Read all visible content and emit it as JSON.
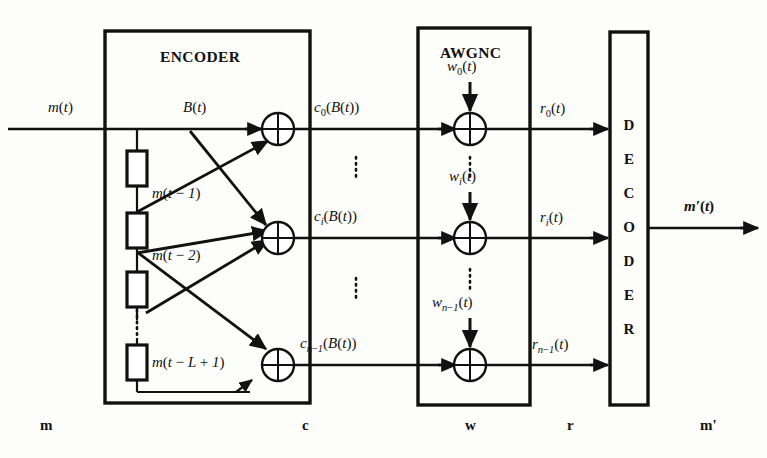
{
  "figure": {
    "type": "block-diagram"
  },
  "blocks": {
    "encoder": {
      "title": "ENCODER",
      "x": 105,
      "y": 31,
      "w": 205,
      "h": 372
    },
    "awgnc": {
      "title": "AWGNC",
      "x": 418,
      "y": 28,
      "w": 112,
      "h": 377
    },
    "decoder": {
      "title": "DECODER",
      "x": 610,
      "y": 32,
      "w": 38,
      "h": 373,
      "letters": [
        "D",
        "E",
        "C",
        "O",
        "D",
        "E",
        "R"
      ]
    }
  },
  "signals": {
    "input": "m(t)",
    "branch": "B(t)",
    "encoder_out_0": "c0(B(t))",
    "encoder_out_i": "ci(B(t))",
    "encoder_out_n1": "cn-1(B(t))",
    "noise_0": "w0(t)",
    "noise_i": "wi(t)",
    "noise_n1": "wn-1(t)",
    "received_0": "r0(t)",
    "received_i": "ri(t)",
    "received_n1": "rn-1(t)",
    "output": "m'(t)"
  },
  "registers": [
    {
      "label": "m(t-1)",
      "x": 124,
      "y": 151
    },
    {
      "label": "m(t-2)",
      "x": 124,
      "y": 213
    },
    {
      "label": "",
      "x": 124,
      "y": 272
    },
    {
      "label": "m(t-L+1)",
      "x": 124,
      "y": 345
    }
  ],
  "bottom_labels": [
    {
      "text": "m",
      "x": 40,
      "italic": false
    },
    {
      "text": "c",
      "x": 302,
      "italic": false
    },
    {
      "text": "w",
      "x": 465,
      "italic": false
    },
    {
      "text": "r",
      "x": 567,
      "italic": false
    },
    {
      "text": "m'",
      "x": 700,
      "italic": false
    }
  ],
  "ellipses": {
    "channel_gap_top": "vertical-dots",
    "channel_gap_bottom": "vertical-dots",
    "register_gap": "vertical-dots"
  },
  "rows": {
    "top_y": 129,
    "mid_y": 238,
    "bot_y": 365
  },
  "colors": {
    "line": "#111111",
    "background": "#fdfdfc",
    "text": "#111111"
  }
}
